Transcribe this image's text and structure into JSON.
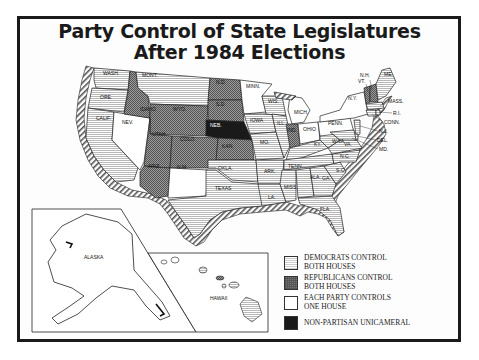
{
  "title": {
    "line1": "Party Control of State Legislatures",
    "line2": "After 1984 Elections"
  },
  "legend": [
    {
      "key": "dem",
      "line1": "DEMOCRATS CONTROL",
      "line2": "BOTH HOUSES",
      "pattern": "horizontal-hatch",
      "color": "#cccccc"
    },
    {
      "key": "rep",
      "line1": "REPUBLICANS CONTROL",
      "line2": "BOTH HOUSES",
      "pattern": "crosshatch",
      "color": "#7a7a7a"
    },
    {
      "key": "each",
      "line1": "EACH PARTY CONTROLS",
      "line2": "ONE HOUSE",
      "pattern": "none",
      "color": "#ffffff"
    },
    {
      "key": "np",
      "line1": "NON-PARTISAN UNICAMERAL",
      "line2": "",
      "pattern": "solid",
      "color": "#1a1a1a"
    }
  ],
  "state_labels": {
    "wash": "WASH.",
    "ore": "ORE.",
    "calif": "CALIF.",
    "idaho": "IDAHO",
    "nev": "NEV.",
    "mont": "MONT.",
    "wyo": "WYO.",
    "utah": "UTAH",
    "ariz": "ARIZ.",
    "colo": "COLO.",
    "nm": "N.M.",
    "nd": "N.D.",
    "sd": "S.D.",
    "neb": "NEB.",
    "kan": "KAN.",
    "okla": "OKLA.",
    "texas": "TEXAS",
    "minn": "MINN.",
    "iowa": "IOWA",
    "mo": "MO.",
    "ark": "ARK.",
    "la": "LA.",
    "wis": "WIS.",
    "ill": "ILL.",
    "mich": "MICH.",
    "ind": "IND.",
    "ohio": "OHIO",
    "ky": "KY.",
    "tenn": "TENN.",
    "miss": "MISS.",
    "ala": "ALA.",
    "ga": "GA.",
    "fla": "FLA.",
    "sc": "S.C.",
    "nc": "N.C.",
    "va": "VA.",
    "wva": "W.VA.",
    "penn": "PENN.",
    "ny": "N.Y.",
    "vt": "VT.",
    "nh": "N.H.",
    "me": "ME.",
    "mass": "MASS.",
    "ri": "R.I.",
    "conn": "CONN.",
    "nj": "N.J.",
    "del": "DEL.",
    "md": "MD.",
    "alaska": "ALASKA",
    "hawaii": "HAWAII"
  },
  "state_control": {
    "democrats_both": [
      "WASH.",
      "ORE.",
      "CALIF.",
      "MONT.",
      "OKLA.",
      "TEXAS",
      "IOWA",
      "MO.",
      "ARK.",
      "LA.",
      "WIS.",
      "ILL.",
      "KY.",
      "TENN.",
      "MISS.",
      "ALA.",
      "GA.",
      "FLA.",
      "S.C.",
      "N.C.",
      "VA.",
      "W.VA.",
      "MD.",
      "MASS.",
      "R.I.",
      "CONN.",
      "DEL.",
      "ME.",
      "HAWAII",
      "N.J."
    ],
    "republicans_both": [
      "IDAHO",
      "WYO.",
      "UTAH",
      "ARIZ.",
      "COLO.",
      "N.D.",
      "S.D.",
      "KAN.",
      "IND.",
      "N.H.",
      "VT."
    ],
    "each_party_one_house": [
      "NEV.",
      "N.M.",
      "MINN.",
      "MICH.",
      "OHIO",
      "PENN.",
      "N.Y.",
      "ALASKA"
    ],
    "non_partisan_unicameral": [
      "NEB."
    ]
  }
}
